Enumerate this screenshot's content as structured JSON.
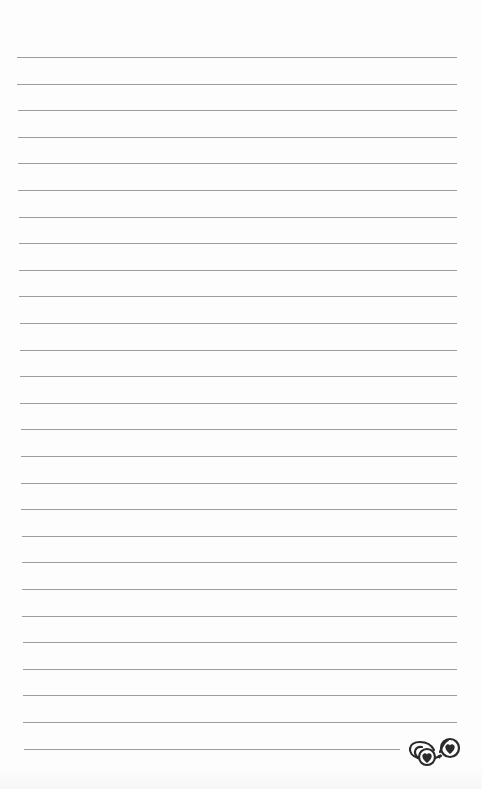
{
  "page": {
    "type": "lined-notepaper",
    "background_color": "#fdfdfd",
    "rule_color": "#9d9d9d",
    "rule_count": 27,
    "rule_top": 57,
    "rule_spacing": 26.6,
    "rule_left": 17,
    "rule_right": 457,
    "last_rule_right": 400
  },
  "ornament": {
    "icon": "swirl-hearts-flourish-icon",
    "color": "#2a2a2a"
  }
}
